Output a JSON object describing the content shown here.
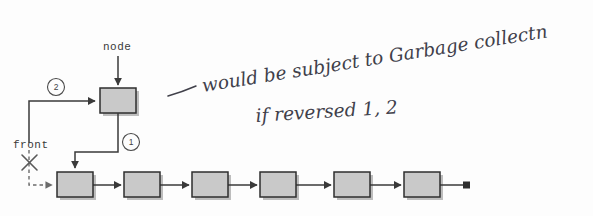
{
  "figure": {
    "background_color": "#fdfdfd",
    "box_fill": "#c9c9c9",
    "box_stroke": "#2e2e2e",
    "shadow_color": "#bdbdbd",
    "line_color": "#3a3a3a",
    "ink_color": "#40404a"
  },
  "labels": {
    "node": "node",
    "front": "front",
    "step_one": "1",
    "step_two": "2"
  },
  "annotation": {
    "dash": "—",
    "line1": "would be subject to Garbage collectn",
    "line2": "if reversed  1, 2",
    "line1_words": [
      "would",
      "be",
      "subject",
      "to",
      "Garbage",
      "collectn"
    ],
    "line2_words": [
      "if",
      "reversed",
      "1,",
      "2"
    ]
  },
  "chain": {
    "node_count": 6,
    "terminator": "null-square",
    "boxes": [
      {
        "index": 1,
        "x": 57,
        "y": 172,
        "w": 36,
        "h": 25
      },
      {
        "index": 2,
        "x": 124,
        "y": 172,
        "w": 36,
        "h": 25
      },
      {
        "index": 3,
        "x": 192,
        "y": 172,
        "w": 36,
        "h": 25
      },
      {
        "index": 4,
        "x": 260,
        "y": 172,
        "w": 36,
        "h": 25
      },
      {
        "index": 5,
        "x": 334,
        "y": 172,
        "w": 36,
        "h": 25
      },
      {
        "index": 6,
        "x": 404,
        "y": 172,
        "w": 36,
        "h": 25
      }
    ]
  },
  "node_box": {
    "x": 100,
    "y": 88,
    "w": 36,
    "h": 25
  }
}
